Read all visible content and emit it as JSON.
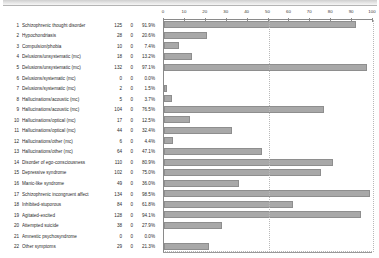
{
  "window": {
    "title": ""
  },
  "chart_data": {
    "type": "bar",
    "title": "",
    "xlabel": "",
    "ylabel": "",
    "xlim": [
      0,
      100
    ],
    "xticks": [
      0,
      10,
      20,
      30,
      40,
      50,
      60,
      70,
      80,
      90,
      100
    ],
    "grid": true,
    "gridlines_at": [
      50,
      100
    ],
    "orientation": "horizontal",
    "bar_color": "#a8a8a8",
    "columns": [
      "#",
      "Symptom",
      "N",
      "Missing",
      "Percent"
    ],
    "categories": [
      "Schizophrenic thought disorder",
      "Hypochondriasis",
      "Compulsion/phobia",
      "Delusions/unsystematic  (mc)",
      "Delusions/unsystematic  (mc)",
      "Delusions/systematic    (mc)",
      "Delusions/systematic    (mc)",
      "Hallucinations/acoustic (mc)",
      "Hallucinations/acoustic (mc)",
      "Hallucinations/optical  (mc)",
      "Hallucinations/optical  (mc)",
      "Hallucinations/other    (mc)",
      "Hallucinations/other    (mc)",
      "Disorder of ego-consciousness",
      "Depressive syndrome",
      "Manic-like syndrome",
      "Schizophrenic incongruent affect",
      "Inhibited-stuporous",
      "Agitated-excited",
      "Attempted suicide",
      "Amnestic psychosyndrome",
      "Other symptoms"
    ],
    "values": [
      91.9,
      20.6,
      7.4,
      13.2,
      97.1,
      0.0,
      1.5,
      3.7,
      76.5,
      12.5,
      32.4,
      4.4,
      47.1,
      80.9,
      75.0,
      36.0,
      98.5,
      61.8,
      94.1,
      27.9,
      0.0,
      21.3
    ],
    "counts": [
      125,
      28,
      10,
      18,
      132,
      0,
      2,
      5,
      104,
      17,
      44,
      6,
      64,
      110,
      102,
      49,
      134,
      84,
      128,
      38,
      0,
      29
    ],
    "missing": [
      0,
      0,
      0,
      0,
      0,
      0,
      0,
      0,
      0,
      0,
      0,
      0,
      0,
      0,
      0,
      0,
      0,
      0,
      0,
      0,
      0,
      0
    ],
    "percent_labels": [
      "91.9%",
      "20.6%",
      "7.4%",
      "13.2%",
      "97.1%",
      "0.0%",
      "1.5%",
      "3.7%",
      "76.5%",
      "12.5%",
      "32.4%",
      "4.4%",
      "47.1%",
      "80.9%",
      "75.0%",
      "36.0%",
      "98.5%",
      "61.8%",
      "94.1%",
      "27.9%",
      "0.0%",
      "21.3%"
    ],
    "indices": [
      "1",
      "2",
      "3",
      "4",
      "5",
      "6",
      "7",
      "8",
      "9",
      "10",
      "11",
      "12",
      "13",
      "14",
      "15",
      "16",
      "17",
      "18",
      "19",
      "20",
      "21",
      "22"
    ]
  }
}
